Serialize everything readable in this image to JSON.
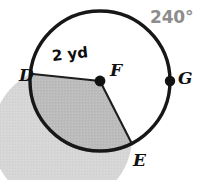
{
  "figure": {
    "type": "circle-diagram",
    "background_color": "#ffffff"
  },
  "labels": {
    "center_point": "F",
    "point_left": "D",
    "point_right": "G",
    "point_lower_right": "E",
    "arc_angle": "240°",
    "radius_measure": "2 yd"
  },
  "geometry": {
    "center": {
      "x": 100,
      "y": 81
    },
    "radius_px": 70,
    "radius_value": 2,
    "radius_units": "yd",
    "arc_angle_degrees": 240,
    "points": [
      {
        "name": "D",
        "angle_deg": 186,
        "marker": false
      },
      {
        "name": "G",
        "angle_deg": 0,
        "marker": true
      },
      {
        "name": "E",
        "angle_deg": 297,
        "marker": false
      }
    ],
    "radii_drawn": [
      "FD",
      "FE"
    ]
  },
  "colors": {
    "outline": "#171717",
    "fill_light": "#d4d4d4",
    "fill_dark": "#b9b9b9",
    "angle_text": "#8d8d8d",
    "point_text": "#111111",
    "measure_text": "#0d0d0d"
  }
}
